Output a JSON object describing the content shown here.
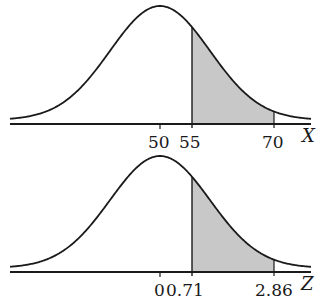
{
  "chart_data": [
    {
      "type": "area",
      "title": "",
      "xlabel": "X",
      "ylabel": "",
      "distribution": "normal",
      "mean": 50,
      "tick_labels": [
        "50",
        "55",
        "70"
      ],
      "tick_values": [
        50,
        55,
        70
      ],
      "shaded_region": {
        "from": 55,
        "to": 70
      },
      "grid": false
    },
    {
      "type": "area",
      "title": "",
      "xlabel": "Z",
      "ylabel": "",
      "distribution": "standard normal",
      "mean": 0,
      "tick_labels": [
        "0",
        "0.71",
        "2.86"
      ],
      "tick_values": [
        0,
        0.71,
        2.86
      ],
      "shaded_region": {
        "from": 0.71,
        "to": 2.86
      },
      "grid": false
    }
  ],
  "colors": {
    "line": "#1a1a1a",
    "shade": "#c8c8c8"
  },
  "panels": [
    {
      "axis_label": "X",
      "ticks": [
        {
          "label": "50",
          "px": 160
        },
        {
          "label": "55",
          "px": 192
        },
        {
          "label": "70",
          "px": 274
        }
      ],
      "label_x": [
        148,
        179,
        262
      ],
      "axis_label_x": 302,
      "axis_y": 124,
      "peak_y": 6,
      "center_px": 160,
      "sigma_px": 50,
      "shade_from_px": 192,
      "shade_to_px": 274
    },
    {
      "axis_label": "Z",
      "ticks": [
        {
          "label": "0",
          "px": 160
        },
        {
          "label": "0.71",
          "px": 192
        },
        {
          "label": "2.86",
          "px": 274
        }
      ],
      "label_x": [
        154,
        166,
        255
      ],
      "axis_label_x": 301,
      "axis_y": 272,
      "peak_y": 156,
      "center_px": 160,
      "sigma_px": 50,
      "shade_from_px": 192,
      "shade_to_px": 274
    }
  ]
}
